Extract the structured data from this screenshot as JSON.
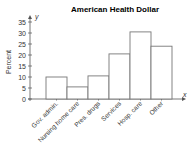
{
  "chart_data": {
    "type": "bar",
    "title": "American Health Dollar",
    "xlabel": "x",
    "ylabel": "Percent",
    "y_axis_letter": "y",
    "categories": [
      "Gov. admin.",
      "Nursing home care",
      "Pres. drugs",
      "Services",
      "Hosp. care",
      "Other"
    ],
    "values": [
      10,
      5.5,
      10.5,
      20.5,
      30.5,
      24
    ],
    "ylim": [
      0,
      35
    ],
    "yticks": [
      0,
      5,
      10,
      15,
      20,
      25,
      30,
      35
    ],
    "grid": false,
    "legend": null
  }
}
